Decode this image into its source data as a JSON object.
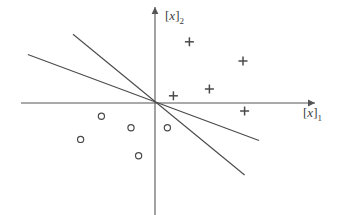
{
  "chart_data": {
    "type": "scatter",
    "title": "",
    "subtitle": "",
    "xlabel": "[x]_1",
    "ylabel": "[x]_2",
    "xlabel_base": "x",
    "xlabel_sub": "1",
    "ylabel_base": "x",
    "ylabel_sub": "2",
    "grid": false,
    "legend": false,
    "legend_position": "none",
    "xlim": [
      -3.6,
      4.2
    ],
    "ylim": [
      -3.5,
      2.6
    ],
    "axes": {
      "x_axis_y": 0,
      "y_axis_x": 0,
      "x_axis_from": -3.35,
      "x_axis_to": 4.0,
      "y_axis_from": -3.3,
      "y_axis_to": 2.4,
      "arrow_x": true,
      "arrow_y": true
    },
    "series": [
      {
        "name": "class-plus",
        "marker": "+",
        "color": "#4a4a4a",
        "points": [
          {
            "x": 0.86,
            "y": 1.53
          },
          {
            "x": 2.2,
            "y": 1.05
          },
          {
            "x": 1.36,
            "y": 0.35
          },
          {
            "x": 0.46,
            "y": 0.18
          },
          {
            "x": 2.24,
            "y": -0.2
          }
        ]
      },
      {
        "name": "class-circle",
        "marker": "o",
        "color": "#4a4a4a",
        "points": [
          {
            "x": -1.34,
            "y": -0.33
          },
          {
            "x": -0.6,
            "y": -0.62
          },
          {
            "x": -1.86,
            "y": -0.91
          },
          {
            "x": -0.41,
            "y": -1.32
          },
          {
            "x": 0.31,
            "y": -0.62
          }
        ]
      }
    ],
    "lines": [
      {
        "name": "decision-boundary-steep",
        "from": {
          "x": -2.05,
          "y": 1.72
        },
        "to": {
          "x": 2.24,
          "y": -1.8
        },
        "color": "#4a4a4a"
      },
      {
        "name": "decision-boundary-shallow",
        "from": {
          "x": -3.18,
          "y": 1.21
        },
        "to": {
          "x": 2.6,
          "y": -0.94
        },
        "color": "#4a4a4a"
      }
    ]
  }
}
